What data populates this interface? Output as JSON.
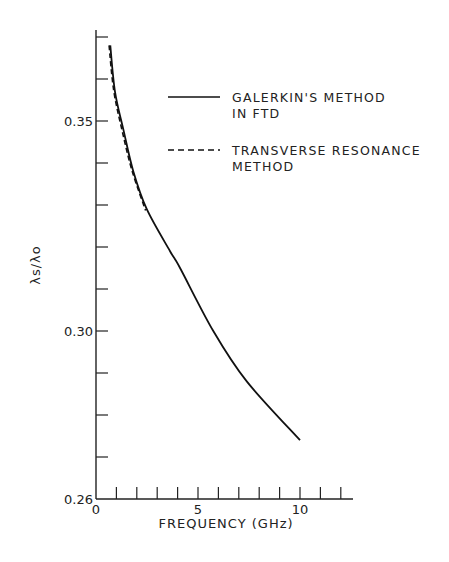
{
  "chart_data": {
    "type": "line",
    "title": "",
    "xlabel": "FREQUENCY (GHz)",
    "ylabel": "λs/λo",
    "xlim": [
      0,
      12.5
    ],
    "ylim": [
      0.26,
      0.372
    ],
    "x_ticks": [
      0,
      1,
      2,
      3,
      4,
      5,
      6,
      7,
      8,
      9,
      10,
      11,
      12
    ],
    "x_tick_labels": [
      "0",
      "5",
      "10"
    ],
    "x_tick_label_values": [
      0,
      5,
      10
    ],
    "y_ticks": [
      0.26,
      0.27,
      0.28,
      0.29,
      0.3,
      0.31,
      0.32,
      0.33,
      0.34,
      0.35,
      0.36,
      0.37
    ],
    "y_tick_labels": [
      "0.26",
      "0.30",
      "0.35"
    ],
    "y_tick_label_values": [
      0.26,
      0.3,
      0.35
    ],
    "grid": false,
    "legend_position": "upper right",
    "series": [
      {
        "name": "GALERKIN'S METHOD IN FTD",
        "style": "solid",
        "x": [
          0.7,
          0.93,
          1.34,
          1.83,
          2.49,
          3.63,
          4.12,
          5.75,
          7.39,
          10.0
        ],
        "y": [
          0.368,
          0.357,
          0.348,
          0.338,
          0.329,
          0.319,
          0.315,
          0.3,
          0.288,
          0.274
        ]
      },
      {
        "name": "TRANSVERSE RESONANCE METHOD",
        "style": "dashed",
        "x": [
          0.7,
          0.93,
          1.34,
          1.83,
          2.49
        ],
        "y": [
          0.368,
          0.3572,
          0.3477,
          0.3381,
          0.3287
        ]
      }
    ]
  },
  "legend": {
    "entries": [
      {
        "line1": "GALERKIN'S METHOD",
        "line2": "IN FTD",
        "style": "solid"
      },
      {
        "line1": "TRANSVERSE RESONANCE",
        "line2": "METHOD",
        "style": "dashed"
      }
    ]
  },
  "colors": {
    "line": "#111111",
    "axis": "#222222",
    "background": "#ffffff"
  }
}
